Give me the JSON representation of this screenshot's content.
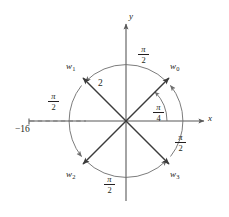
{
  "figure": {
    "kind": "complex-plane-roots-diagram",
    "axes": {
      "x_label": "x",
      "y_label": "y"
    },
    "tick": {
      "label": "−16",
      "on_axis": "x",
      "value": -16
    },
    "radius_label": "2",
    "first_angle": {
      "numerator": "π",
      "denominator": "4",
      "text": "π/4"
    },
    "arc_angle": {
      "numerator": "π",
      "denominator": "2",
      "text": "π/2"
    },
    "roots": [
      {
        "name": "w",
        "index": "0",
        "angle_deg": 45,
        "modulus": 2
      },
      {
        "name": "w",
        "index": "1",
        "angle_deg": 135,
        "modulus": 2
      },
      {
        "name": "w",
        "index": "2",
        "angle_deg": 225,
        "modulus": 2
      },
      {
        "name": "w",
        "index": "3",
        "angle_deg": 315,
        "modulus": 2
      }
    ],
    "arc_labels": [
      {
        "id": "arc-top",
        "numerator": "π",
        "denominator": "2"
      },
      {
        "id": "arc-left",
        "numerator": "π",
        "denominator": "2"
      },
      {
        "id": "arc-bottom",
        "numerator": "π",
        "denominator": "2"
      },
      {
        "id": "arc-right",
        "numerator": "π",
        "denominator": "2"
      }
    ],
    "colors": {
      "ink": "#231f20",
      "axis": "#595959",
      "arc": "#6d6d6d",
      "background": "#ffffff"
    }
  }
}
